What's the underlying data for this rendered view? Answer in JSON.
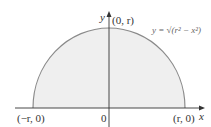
{
  "diagram": {
    "axes": {
      "x_label": "x",
      "y_label": "y",
      "origin_label": "0"
    },
    "points": {
      "top": "(0, r)",
      "left": "(−r, 0)",
      "right": "(r, 0)"
    },
    "curve_label": "y = √(r² − x²)",
    "colors": {
      "fill": "#efefef",
      "curve": "#8a8a8a",
      "axis": "#333333"
    }
  }
}
